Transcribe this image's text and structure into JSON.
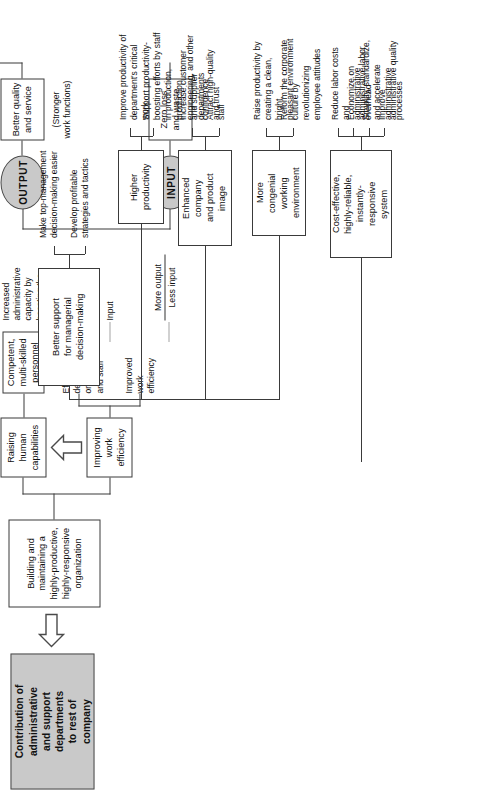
{
  "diagram": {
    "title_box": "Contribution of\nadministrative\nand support\ndepartments\nto rest of\ncompany",
    "ovals": {
      "output": "OUTPUT",
      "input": "INPUT"
    },
    "foundation": {
      "label": "Building and\nmaintaining a\nhighly-productive,\nhighly-responsive\norganization"
    },
    "pillars": [
      {
        "label": "Raising\nhuman\ncapabilities"
      },
      {
        "label": "Improving\nwork\nefficiency"
      }
    ],
    "means": [
      {
        "label": "Competent,\nmulti-skilled\npersonnel"
      },
      {
        "label": "Efficient\ndeployment of\norganizations\nand staff"
      },
      {
        "label": "Improved\nwork\nefficiency"
      }
    ],
    "effects": [
      {
        "label": "Increased\nadministrative\ncapacity by\nboosting the\ncapacity to\nprocess\nand digest\ninformation"
      },
      {
        "label": "Input"
      }
    ],
    "ratio": {
      "numerator": "More output",
      "denominator": "Less input"
    },
    "output_branch": {
      "headline": "Better quality\nand service",
      "subtitle": "(Stronger\nwork functions)"
    },
    "input_branch": {
      "headline": "Zero loss\nand waste"
    },
    "result_boxes": [
      {
        "label": "Better support\nfor managerial\ndecision-making",
        "notes": [
          "Make top-management\ndecision-making easier",
          "Develop profitable\nstrategies and tactics"
        ]
      },
      {
        "label": "Higher\nproductivity",
        "notes": [
          "Improve productivity of\ndepartment's critical work",
          "Support productivity-\nboosting efforts by staff\nin production, production\nengineering, and other\ndepartments"
        ]
      },
      {
        "label": "Enhanced\ncompany\nand product\nimage",
        "notes": [
          "Increase customer\nand supplier confidence\nand trust",
          "Attract high-quality staff"
        ]
      },
      {
        "label": "More\ncongenial\nworking\nenvironment",
        "notes": [
          "Raise productivity by\ncreating a clean, bright,\npleasant environment",
          "Reform the corporate\nculture by revolutionizing\nemployee attitudes"
        ]
      },
      {
        "label": "Cost-effective,\nhighly-reliable,\ninstantly-\nresponsive\nsystem",
        "notes": [
          "Reduce labor costs and\nadministrative overhead",
          "Economize on\nadministrative labor",
          "Simplify, standardize,\nand accelerate\nadministrative processes",
          "Improve\nadministrative quality"
        ]
      }
    ],
    "colors": {
      "line": "#3a3a3a",
      "fill_gray": "#c9c9c9",
      "paper": "#ffffff"
    }
  }
}
